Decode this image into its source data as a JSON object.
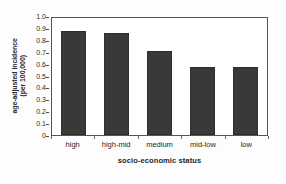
{
  "chart_data": {
    "type": "bar",
    "title": "",
    "categories": [
      "high",
      "high-mid",
      "medium",
      "mid-low",
      "low"
    ],
    "values": [
      0.89,
      0.875,
      0.72,
      0.585,
      0.578
    ],
    "series": [
      {
        "name": "age-adjusted incidence (per 100,000)",
        "values": [
          0.89,
          0.875,
          0.72,
          0.585,
          0.578
        ]
      }
    ],
    "xlabel": "socio-economic status",
    "ylabel": "age-adjusted incidence (per 100,000)",
    "ylabel_line1": "age-adjusted incidence",
    "ylabel_line2": "(per 100,000)",
    "ylim": [
      0,
      1.0
    ],
    "ytick_labels": [
      "1.0",
      "0.9",
      "0.8",
      "0.7",
      "0.6",
      "0.5",
      "0.4",
      "0.3",
      "0.2",
      "0.1",
      "0"
    ],
    "ytick_values": [
      1.0,
      0.9,
      0.8,
      0.7,
      0.6,
      0.5,
      0.4,
      0.3,
      0.2,
      0.1,
      0
    ],
    "grid": false,
    "legend": null,
    "legend_position": "none",
    "bar_color": "#393939",
    "frame_color": "#555555",
    "background_color": "#ffffff",
    "annotations": []
  }
}
